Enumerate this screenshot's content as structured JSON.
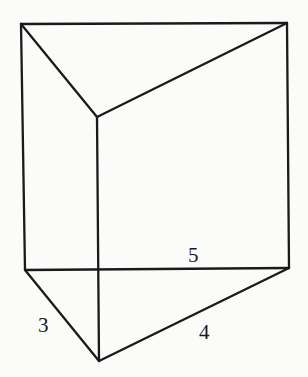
{
  "diagram": {
    "stroke_color": "#1a1a1a",
    "background": "#fbfbfa",
    "vertices": {
      "top_left": [
        21,
        24
      ],
      "top_right": [
        287,
        23
      ],
      "top_front": [
        97,
        117
      ],
      "bottom_left": [
        25,
        270
      ],
      "bottom_right": [
        289,
        268
      ],
      "bottom_front": [
        99,
        361
      ]
    },
    "labels": {
      "hypotenuse": "5",
      "left_leg": "3",
      "right_leg": "4"
    }
  }
}
